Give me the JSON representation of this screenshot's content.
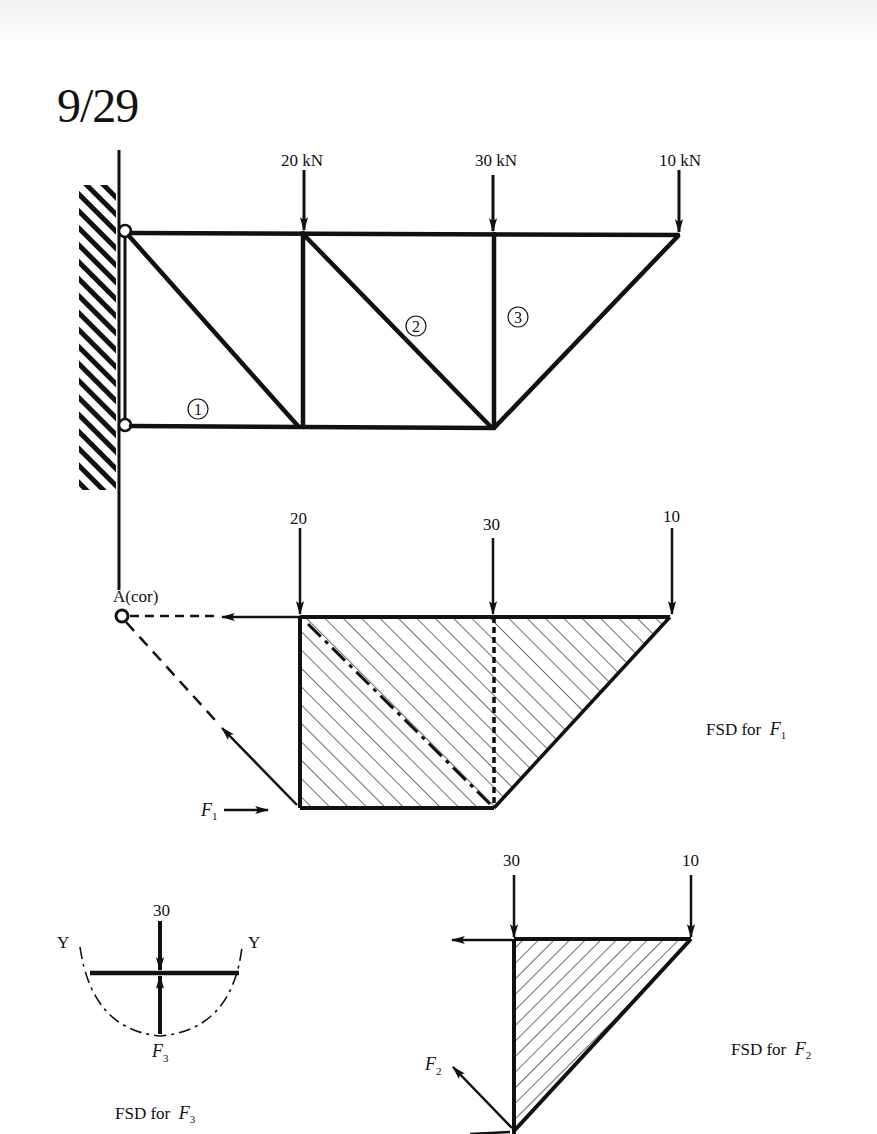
{
  "document": {
    "problem_number": "9/29"
  },
  "truss": {
    "loads": [
      {
        "label": "20 kN",
        "value": 20,
        "unit": "kN"
      },
      {
        "label": "30 kN",
        "value": 30,
        "unit": "kN"
      },
      {
        "label": "10 kN",
        "value": 10,
        "unit": "kN"
      }
    ],
    "members": [
      {
        "id": "1",
        "label": "①"
      },
      {
        "id": "2",
        "label": "②"
      },
      {
        "id": "3",
        "label": "③"
      }
    ],
    "support": "wall-pinned"
  },
  "fsd_f1": {
    "loads": [
      "20",
      "30",
      "10"
    ],
    "pivot_label": "A(cor)",
    "force_label": "F",
    "force_sub": "1",
    "caption_prefix": "FSD for",
    "caption_var": "F",
    "caption_sub": "1"
  },
  "fsd_f2": {
    "loads": [
      "30",
      "10"
    ],
    "force_label": "F",
    "force_sub": "2",
    "caption_prefix": "FSD for",
    "caption_var": "F",
    "caption_sub": "2"
  },
  "fsd_f3": {
    "load": "30",
    "section_left": "Y",
    "section_right": "Y",
    "force_label": "F",
    "force_sub": "3",
    "caption_prefix": "FSD for",
    "caption_var": "F",
    "caption_sub": "3"
  }
}
